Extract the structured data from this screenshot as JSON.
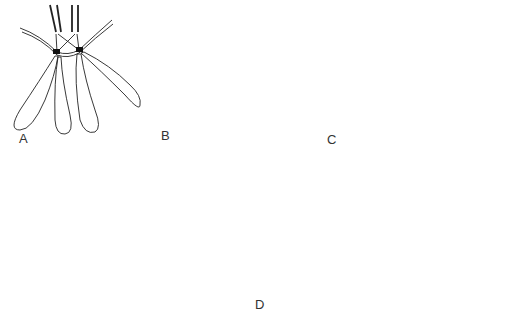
{
  "figure": {
    "panels": [
      {
        "id": "A",
        "label": "A",
        "description": "Two homologous chromosomes attached to spindle fibres; four unshaded chromatid arms"
      },
      {
        "id": "B",
        "label": "B",
        "description": "Paired chromosomes with shaded and unshaded chromatids, crossing kinetochore fibres"
      },
      {
        "id": "C",
        "label": "C",
        "description": "Separating homologues: unshaded chromatids left, shaded chromatids right"
      },
      {
        "id": "D",
        "label": "D",
        "description": "Anaphase/telophase: unshaded chromatids at left pole, shaded chromatids at right pole inside cell envelope"
      }
    ],
    "colors": {
      "line": "#222222",
      "fill_shaded": "#bdbdbd",
      "background": "#ffffff"
    }
  }
}
